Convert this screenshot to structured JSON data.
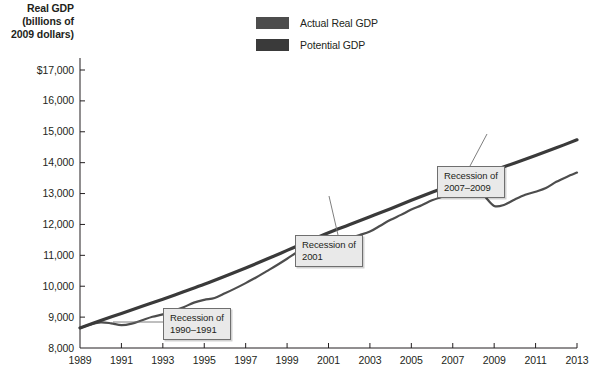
{
  "chart_data": {
    "type": "line",
    "title": "",
    "xlabel": "",
    "ylabel": "Real GDP (billions of 2009 dollars)",
    "ylabel_lines": [
      "Real GDP",
      "(billions of",
      "2009 dollars)"
    ],
    "xlim": [
      1989,
      2013
    ],
    "ylim": [
      8000,
      17000
    ],
    "grid": false,
    "legend_position": "top-center",
    "y_ticks": [
      {
        "value": 17000,
        "label": "$17,000"
      },
      {
        "value": 16000,
        "label": "16,000"
      },
      {
        "value": 15000,
        "label": "15,000"
      },
      {
        "value": 14000,
        "label": "14,000"
      },
      {
        "value": 13000,
        "label": "13,000"
      },
      {
        "value": 12000,
        "label": "12,000"
      },
      {
        "value": 11000,
        "label": "11,000"
      },
      {
        "value": 10000,
        "label": "10,000"
      },
      {
        "value": 9000,
        "label": "9,000"
      },
      {
        "value": 8000,
        "label": "8,000"
      }
    ],
    "x_ticks": [
      {
        "value": 1989,
        "label": "1989"
      },
      {
        "value": 1991,
        "label": "1991"
      },
      {
        "value": 1993,
        "label": "1993"
      },
      {
        "value": 1995,
        "label": "1995"
      },
      {
        "value": 1997,
        "label": "1997"
      },
      {
        "value": 1999,
        "label": "1999"
      },
      {
        "value": 2001,
        "label": "2001"
      },
      {
        "value": 2003,
        "label": "2003"
      },
      {
        "value": 2005,
        "label": "2005"
      },
      {
        "value": 2007,
        "label": "2007"
      },
      {
        "value": 2009,
        "label": "2009"
      },
      {
        "value": 2011,
        "label": "2011"
      },
      {
        "value": 2013,
        "label": "2013"
      }
    ],
    "series": [
      {
        "name": "Actual Real GDP",
        "color": "#4d4d4d",
        "x": [
          1989.0,
          1989.5,
          1990.0,
          1990.5,
          1991.0,
          1991.5,
          1992.0,
          1992.5,
          1993.0,
          1993.5,
          1994.0,
          1994.5,
          1995.0,
          1995.5,
          1996.0,
          1996.5,
          1997.0,
          1997.5,
          1998.0,
          1998.5,
          1999.0,
          1999.5,
          2000.0,
          2000.5,
          2001.0,
          2001.5,
          2002.0,
          2002.5,
          2003.0,
          2003.5,
          2004.0,
          2004.5,
          2005.0,
          2005.5,
          2006.0,
          2006.5,
          2007.0,
          2007.5,
          2008.0,
          2008.5,
          2009.0,
          2009.5,
          2010.0,
          2010.5,
          2011.0,
          2011.5,
          2012.0,
          2012.5,
          2013.0
        ],
        "values": [
          8650,
          8760,
          8830,
          8800,
          8740,
          8790,
          8900,
          9010,
          9090,
          9200,
          9320,
          9470,
          9560,
          9620,
          9770,
          9930,
          10100,
          10280,
          10480,
          10680,
          10890,
          11110,
          11310,
          11420,
          11450,
          11480,
          11560,
          11660,
          11770,
          11960,
          12150,
          12310,
          12480,
          12620,
          12780,
          12900,
          13010,
          13100,
          13080,
          12930,
          12600,
          12640,
          12810,
          12960,
          13060,
          13180,
          13380,
          13540,
          13680
        ]
      },
      {
        "name": "Potential GDP",
        "color": "#3a3a3a",
        "x": [
          1989.0,
          1990.0,
          1991.0,
          1992.0,
          1993.0,
          1994.0,
          1995.0,
          1996.0,
          1997.0,
          1998.0,
          1999.0,
          2000.0,
          2001.0,
          2002.0,
          2003.0,
          2004.0,
          2005.0,
          2006.0,
          2007.0,
          2008.0,
          2009.0,
          2010.0,
          2011.0,
          2012.0,
          2013.0
        ],
        "values": [
          8650,
          8890,
          9120,
          9350,
          9580,
          9820,
          10060,
          10320,
          10590,
          10870,
          11160,
          11450,
          11730,
          11990,
          12250,
          12510,
          12780,
          13040,
          13290,
          13530,
          13760,
          13990,
          14230,
          14480,
          14740
        ]
      }
    ],
    "annotations": [
      {
        "id": "recession-1990-1991",
        "lines": [
          "Recession of",
          "1990–1991"
        ],
        "target_x": 1991.0,
        "target_y": 8740
      },
      {
        "id": "recession-2001",
        "lines": [
          "Recession of",
          "2001"
        ],
        "target_x": 2001.4,
        "target_y": 11500
      },
      {
        "id": "recession-2007-2009",
        "lines": [
          "Recession of",
          "2007–2009"
        ],
        "target_x": 2009.0,
        "target_y": 12600
      }
    ]
  },
  "legend": {
    "items": [
      {
        "label": "Actual Real GDP",
        "color": "#4d4d4d"
      },
      {
        "label": "Potential GDP",
        "color": "#3a3a3a"
      }
    ]
  }
}
